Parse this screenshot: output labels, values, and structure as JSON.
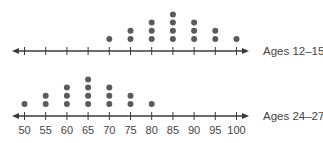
{
  "chart_data": {
    "type": "scatter",
    "subtype": "dot-plot",
    "title": "",
    "xlabel": "",
    "ylabel": "",
    "x_ticks": [
      50,
      55,
      60,
      65,
      70,
      75,
      80,
      85,
      90,
      95,
      100
    ],
    "tick_labels": [
      "50",
      "55",
      "60",
      "65",
      "70",
      "75",
      "80",
      "85",
      "90",
      "95",
      "100"
    ],
    "xlim": [
      50,
      100
    ],
    "grid": false,
    "series": [
      {
        "name": "Ages 12–15",
        "values": [
          70,
          75,
          75,
          80,
          80,
          80,
          85,
          85,
          85,
          85,
          90,
          90,
          90,
          95,
          95,
          100
        ],
        "counts": {
          "70": 1,
          "75": 2,
          "80": 3,
          "85": 4,
          "90": 3,
          "95": 2,
          "100": 1
        }
      },
      {
        "name": "Ages 24–27",
        "values": [
          50,
          55,
          55,
          60,
          60,
          60,
          65,
          65,
          65,
          65,
          70,
          70,
          70,
          75,
          75,
          80
        ],
        "counts": {
          "50": 1,
          "55": 2,
          "60": 3,
          "65": 4,
          "70": 3,
          "75": 2,
          "80": 1
        }
      }
    ]
  },
  "colors": {
    "dot": "#5b5b5b",
    "axis": "#3a3a3a",
    "text": "#444444"
  }
}
